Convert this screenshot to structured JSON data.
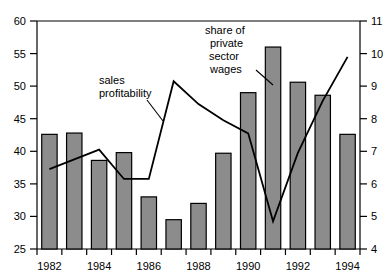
{
  "chart_data": {
    "type": "bar",
    "title": "",
    "subtitle": "",
    "xlabel": "",
    "ylabel": "",
    "grid": false,
    "legend_position": "inline-annotations",
    "categories": [
      "1982",
      "1983",
      "1984",
      "1985",
      "1986",
      "1987",
      "1988",
      "1989",
      "1990",
      "1991",
      "1992",
      "1993",
      "1994"
    ],
    "x_tick_labels": [
      "1982",
      "1984",
      "1986",
      "1988",
      "1990",
      "1992",
      "1994"
    ],
    "left_axis": {
      "label": "",
      "ylim": [
        25,
        60
      ],
      "ticks": [
        25,
        30,
        35,
        40,
        45,
        50,
        55,
        60
      ],
      "tick_labels": [
        "25",
        "30",
        "35",
        "40",
        "45",
        "50",
        "55",
        "60"
      ]
    },
    "right_axis": {
      "label": "",
      "ylim": [
        4,
        11
      ],
      "ticks": [
        4,
        5,
        6,
        7,
        8,
        9,
        10,
        11
      ],
      "tick_labels": [
        "4",
        "5",
        "6",
        "7",
        "8",
        "9",
        "10",
        "11"
      ]
    },
    "series": [
      {
        "name": "share of private sector wages",
        "type": "bar",
        "axis": "left",
        "color": "#8c8c8c",
        "edge_color": "#000000",
        "values": [
          42.6,
          42.8,
          38.6,
          39.8,
          33.0,
          29.5,
          32.0,
          39.7,
          49.0,
          56.0,
          50.6,
          48.6,
          42.6
        ]
      },
      {
        "name": "sales profitability",
        "type": "line",
        "axis": "right",
        "color": "#000000",
        "values": [
          6.45,
          6.75,
          7.05,
          6.15,
          6.15,
          9.15,
          8.45,
          7.95,
          7.55,
          4.85,
          6.95,
          8.55,
          9.9
        ]
      }
    ],
    "annotations": [
      {
        "name": "sales-profitability",
        "text_lines": [
          "sales",
          "profitability"
        ],
        "points_to_category": "1986"
      },
      {
        "name": "share-of-private-sector-wages",
        "text_lines": [
          "share of",
          "private",
          "sector",
          "wages"
        ],
        "points_to_category": "1991"
      }
    ]
  }
}
